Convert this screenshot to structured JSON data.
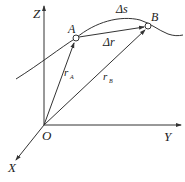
{
  "diagram": {
    "axes": {
      "z_label": "Z",
      "y_label": "Y",
      "x_label": "X",
      "origin_label": "O"
    },
    "points": {
      "a_label": "A",
      "b_label": "B"
    },
    "vectors": {
      "r_a_label": "r",
      "r_a_sub": "A",
      "r_b_label": "r",
      "r_b_sub": "B",
      "delta_r_label": "Δr"
    },
    "arc": {
      "delta_s_label": "Δs"
    },
    "colors": {
      "stroke": "#333333",
      "background": "#ffffff"
    }
  }
}
